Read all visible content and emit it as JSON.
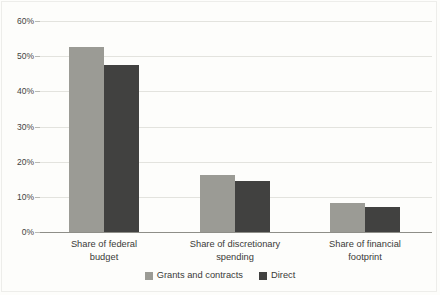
{
  "chart_data": {
    "type": "bar",
    "title": "",
    "subtitle": "",
    "xlabel": "",
    "ylabel": "",
    "categories": [
      "Share of federal budget",
      "Share of discretionary spending",
      "Share of financial footprint"
    ],
    "series": [
      {
        "name": "Grants and contracts",
        "color": "#9b9b95",
        "values": [
          52.5,
          16.1,
          8.2
        ]
      },
      {
        "name": "Direct",
        "color": "#414140",
        "values": [
          47.5,
          14.5,
          7.2
        ]
      }
    ],
    "ylim": [
      0,
      60
    ],
    "yticks": [
      0,
      10,
      20,
      30,
      40,
      50,
      60
    ],
    "ytick_labels": [
      "0%",
      "10%",
      "20%",
      "30%",
      "40%",
      "50%",
      "60%"
    ],
    "grid": true,
    "legend_position": "bottom-center",
    "axis_value_suffix": "%"
  },
  "categories_wrapped": [
    [
      "Share of federal",
      "budget"
    ],
    [
      "Share of discretionary",
      "spending"
    ],
    [
      "Share of financial",
      "footprint"
    ]
  ],
  "legend": {
    "items": [
      {
        "label": "Grants and contracts",
        "color": "#9b9b95"
      },
      {
        "label": "Direct",
        "color": "#414140"
      }
    ]
  },
  "colors": {
    "background": "#fdfdfb",
    "frame": "#ededea",
    "gridline": "#e3e3de",
    "baseline": "#8e8e88",
    "text": "#3a3a38",
    "series_light": "#9b9b95",
    "series_dark": "#414140"
  }
}
